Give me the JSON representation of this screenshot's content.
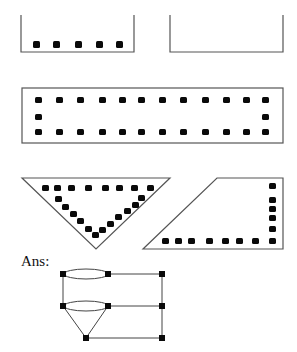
{
  "answer_label": "Ans:",
  "colors": {
    "stroke": "#555555",
    "dot": "#0a0a0a",
    "background": "#ffffff"
  },
  "figures": [
    {
      "name": "open-box-left",
      "dots": 5
    },
    {
      "name": "open-box-right",
      "dots": 0
    },
    {
      "name": "rectangle",
      "dots_top": 12,
      "dots_bottom": 12,
      "dots_middle": 2
    },
    {
      "name": "inverted-triangle",
      "dots_top": 8,
      "dots_left": 5,
      "dots_right": 7
    },
    {
      "name": "trapezoid",
      "dots_bottom": 8,
      "dots_right": 6
    }
  ],
  "answer_graph": {
    "nodes": 8,
    "edges": [
      "oval-top",
      "oval-middle",
      "left-vertical",
      "right-vertical",
      "three-horizontals",
      "triangle-to-bottom-node"
    ]
  }
}
